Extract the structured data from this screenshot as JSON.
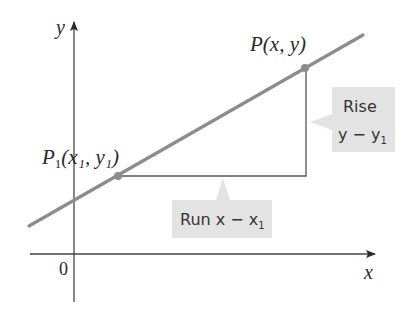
{
  "diagram": {
    "title": "",
    "axes": {
      "x_label": "x",
      "y_label": "y",
      "origin_label": "0",
      "axis_color": "#444444"
    },
    "line": {
      "color": "#8c8c8c",
      "from": [
        29,
        226
      ],
      "to": [
        363,
        35
      ]
    },
    "points": [
      {
        "id": "P",
        "label_main": "P",
        "label_sub": "",
        "label_args": "(x, y)",
        "pixel": [
          305,
          68
        ]
      },
      {
        "id": "P1",
        "label_main": "P",
        "label_sub": "1",
        "label_args": "(x₁, y₁)",
        "pixel": [
          118,
          176
        ]
      }
    ],
    "right_angle_corner": [
      306,
      176
    ],
    "callouts": {
      "rise": {
        "line1": "Rise",
        "line2_main": "y − y",
        "line2_sub": "1",
        "fill": "#e3e3e3"
      },
      "run": {
        "text_main": "Run x − x",
        "text_sub": "1",
        "fill": "#e3e3e3"
      }
    }
  }
}
